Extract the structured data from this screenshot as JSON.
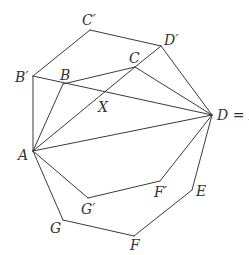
{
  "figure": {
    "stroke_color": "#3a3a3a",
    "background": "#ffffff"
  },
  "points": {
    "A": {
      "label": "A"
    },
    "B": {
      "label": "B"
    },
    "C": {
      "label": "C"
    },
    "D": {
      "label": "D = E′"
    },
    "E": {
      "label": "E"
    },
    "F": {
      "label": "F"
    },
    "G": {
      "label": "G"
    },
    "Bp": {
      "label": "B′"
    },
    "Cp": {
      "label": "C′"
    },
    "Dp": {
      "label": "D′"
    },
    "Fp": {
      "label": "F′"
    },
    "Gp": {
      "label": "G′"
    },
    "X": {
      "label": "X"
    }
  },
  "edges": [
    [
      "A",
      "Bp"
    ],
    [
      "Bp",
      "Cp"
    ],
    [
      "Cp",
      "Dp"
    ],
    [
      "Dp",
      "D"
    ],
    [
      "D",
      "E"
    ],
    [
      "E",
      "F"
    ],
    [
      "F",
      "G"
    ],
    [
      "G",
      "A"
    ],
    [
      "A",
      "B"
    ],
    [
      "B",
      "C"
    ],
    [
      "C",
      "D"
    ],
    [
      "A",
      "C"
    ],
    [
      "A",
      "D"
    ],
    [
      "Bp",
      "D"
    ],
    [
      "A",
      "Gp"
    ],
    [
      "Gp",
      "Fp"
    ],
    [
      "Fp",
      "D"
    ],
    [
      "C",
      "Dp"
    ]
  ],
  "margin_fragments": [
    "o",
    "l",
    "f",
    "e",
    "a",
    "r",
    "e",
    "l",
    "r",
    "e",
    "s"
  ]
}
